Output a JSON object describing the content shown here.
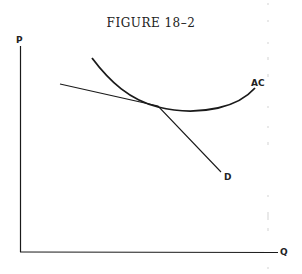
{
  "figure": {
    "title": "FIGURE 18–2",
    "axes": {
      "y_label": "P",
      "x_label": "Q"
    },
    "curves": [
      {
        "name": "AC",
        "label": "AC",
        "description": "U-shaped average cost curve"
      },
      {
        "name": "D",
        "label": "D",
        "description": "Downward-sloping demand curve, kinked at tangency with AC"
      }
    ],
    "colors": {
      "ink": "#1a1a1a",
      "background": "#ffffff"
    }
  }
}
